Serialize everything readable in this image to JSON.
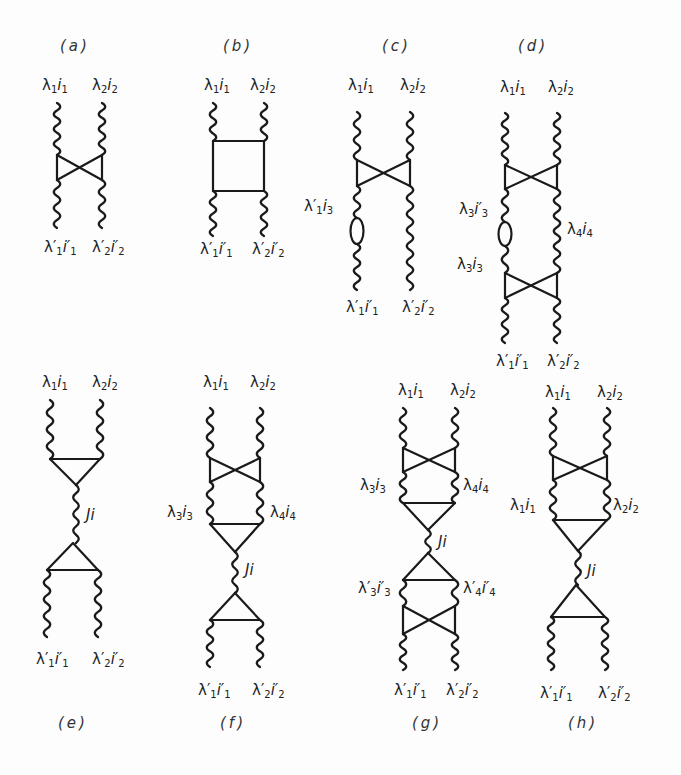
{
  "figure": {
    "stroke_color": "#1a1a1a",
    "background": "#fdfdfd",
    "panels": [
      {
        "id": "a",
        "caption": "(a)",
        "top_labels": [
          {
            "lam": "λ",
            "ls": "1",
            "i": "i",
            "is": "1"
          },
          {
            "lam": "λ",
            "ls": "2",
            "i": "i",
            "is": "2"
          }
        ],
        "bottom_labels": [
          {
            "lam": "λ′",
            "ls": "1",
            "i": "i′",
            "is": "1"
          },
          {
            "lam": "λ′",
            "ls": "2",
            "i": "i′",
            "is": "2"
          }
        ],
        "structure": [
          "wavy",
          "crossed-box",
          "wavy"
        ]
      },
      {
        "id": "b",
        "caption": "(b)",
        "top_labels": [
          {
            "lam": "λ",
            "ls": "1",
            "i": "i",
            "is": "1"
          },
          {
            "lam": "λ",
            "ls": "2",
            "i": "i",
            "is": "2"
          }
        ],
        "bottom_labels": [
          {
            "lam": "λ′",
            "ls": "1",
            "i": "i′",
            "is": "1"
          },
          {
            "lam": "λ′",
            "ls": "2",
            "i": "i′",
            "is": "2"
          }
        ],
        "structure": [
          "wavy",
          "box",
          "wavy"
        ]
      },
      {
        "id": "c",
        "caption": "(c)",
        "top_labels": [
          {
            "lam": "λ",
            "ls": "1",
            "i": "i",
            "is": "1"
          },
          {
            "lam": "λ",
            "ls": "2",
            "i": "i",
            "is": "2"
          }
        ],
        "side_labels": [
          {
            "lam": "λ′",
            "ls": "1",
            "i": "i",
            "is": "3"
          }
        ],
        "bottom_labels": [
          {
            "lam": "λ′",
            "ls": "1",
            "i": "i′",
            "is": "1"
          },
          {
            "lam": "λ′",
            "ls": "2",
            "i": "i′",
            "is": "2"
          }
        ],
        "structure": [
          "wavy",
          "crossed-box",
          "wavy + loop (left)",
          "wavy"
        ]
      },
      {
        "id": "d",
        "caption": "(d)",
        "top_labels": [
          {
            "lam": "λ",
            "ls": "1",
            "i": "i",
            "is": "1"
          },
          {
            "lam": "λ",
            "ls": "2",
            "i": "i",
            "is": "2"
          }
        ],
        "side_labels": [
          {
            "lam": "λ",
            "ls": "3",
            "i": "i′",
            "is": "3"
          },
          {
            "lam": "λ",
            "ls": "3",
            "i": "i",
            "is": "3"
          },
          {
            "lam": "λ",
            "ls": "4",
            "i": "i",
            "is": "4"
          }
        ],
        "bottom_labels": [
          {
            "lam": "λ′",
            "ls": "1",
            "i": "i′",
            "is": "1"
          },
          {
            "lam": "λ′",
            "ls": "2",
            "i": "i′",
            "is": "2"
          }
        ],
        "structure": [
          "wavy",
          "crossed-box",
          "wavy + loop (left)",
          "crossed-box",
          "wavy"
        ]
      },
      {
        "id": "e",
        "caption": "(e)",
        "top_labels": [
          {
            "lam": "λ",
            "ls": "1",
            "i": "i",
            "is": "1"
          },
          {
            "lam": "λ",
            "ls": "2",
            "i": "i",
            "is": "2"
          }
        ],
        "mid_label": "Ji",
        "bottom_labels": [
          {
            "lam": "λ′",
            "ls": "1",
            "i": "i′",
            "is": "1"
          },
          {
            "lam": "λ′",
            "ls": "2",
            "i": "i′",
            "is": "2"
          }
        ],
        "structure": [
          "wavy",
          "triangle-down",
          "wavy Ji",
          "triangle-up",
          "wavy"
        ]
      },
      {
        "id": "f",
        "caption": "(f)",
        "top_labels": [
          {
            "lam": "λ",
            "ls": "1",
            "i": "i",
            "is": "1"
          },
          {
            "lam": "λ",
            "ls": "2",
            "i": "i",
            "is": "2"
          }
        ],
        "side_labels": [
          {
            "lam": "λ",
            "ls": "3",
            "i": "i",
            "is": "3"
          },
          {
            "lam": "λ",
            "ls": "4",
            "i": "i",
            "is": "4"
          }
        ],
        "mid_label": "Ji",
        "bottom_labels": [
          {
            "lam": "λ′",
            "ls": "1",
            "i": "i′",
            "is": "1"
          },
          {
            "lam": "λ′",
            "ls": "2",
            "i": "i′",
            "is": "2"
          }
        ],
        "structure": [
          "wavy",
          "crossed-box",
          "wavy",
          "triangle-down",
          "wavy Ji",
          "triangle-up",
          "wavy"
        ]
      },
      {
        "id": "g",
        "caption": "(g)",
        "top_labels": [
          {
            "lam": "λ",
            "ls": "1",
            "i": "i",
            "is": "1"
          },
          {
            "lam": "λ",
            "ls": "2",
            "i": "i",
            "is": "2"
          }
        ],
        "side_labels": [
          {
            "lam": "λ",
            "ls": "3",
            "i": "i",
            "is": "3"
          },
          {
            "lam": "λ",
            "ls": "4",
            "i": "i",
            "is": "4"
          },
          {
            "lam": "λ′",
            "ls": "3",
            "i": "i′",
            "is": "3"
          },
          {
            "lam": "λ′",
            "ls": "4",
            "i": "i′",
            "is": "4"
          }
        ],
        "mid_label": "Ji",
        "bottom_labels": [
          {
            "lam": "λ′",
            "ls": "1",
            "i": "i′",
            "is": "1"
          },
          {
            "lam": "λ′",
            "ls": "2",
            "i": "i′",
            "is": "2"
          }
        ],
        "structure": [
          "wavy",
          "crossed-box",
          "wavy",
          "triangle-down",
          "wavy Ji",
          "triangle-up",
          "wavy",
          "crossed-box",
          "wavy"
        ]
      },
      {
        "id": "h",
        "caption": "(h)",
        "top_labels": [
          {
            "lam": "λ",
            "ls": "1",
            "i": "i",
            "is": "1"
          },
          {
            "lam": "λ",
            "ls": "2",
            "i": "i",
            "is": "2"
          }
        ],
        "side_labels": [
          {
            "lam": "λ",
            "ls": "1",
            "i": "i",
            "is": "1"
          },
          {
            "lam": "λ",
            "ls": "2",
            "i": "i",
            "is": "2"
          }
        ],
        "mid_label": "Ji",
        "bottom_labels": [
          {
            "lam": "λ′",
            "ls": "1",
            "i": "i′",
            "is": "1"
          },
          {
            "lam": "λ′",
            "ls": "2",
            "i": "i′",
            "is": "2"
          }
        ],
        "structure": [
          "wavy",
          "crossed-box",
          "wavy",
          "triangle-down",
          "wavy Ji",
          "triangle-up",
          "wavy"
        ]
      }
    ]
  }
}
